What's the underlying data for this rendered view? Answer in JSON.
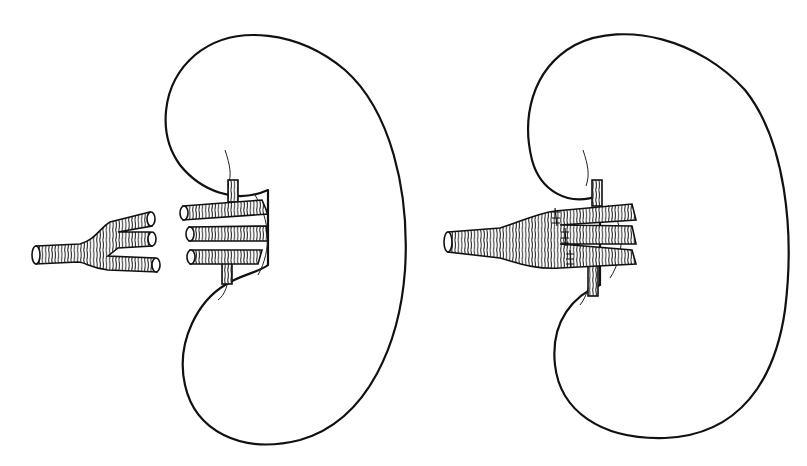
{
  "figure": {
    "panels": [
      {
        "name": "before-anastomosis",
        "description": "Kidney with three separate renal artery stumps and a trifurcated donor vessel graft beside it"
      },
      {
        "name": "after-anastomosis",
        "description": "Kidney with trifurcated graft sutured to the three renal artery branches"
      }
    ],
    "colors": {
      "line": "#111111",
      "background": "#ffffff"
    }
  }
}
